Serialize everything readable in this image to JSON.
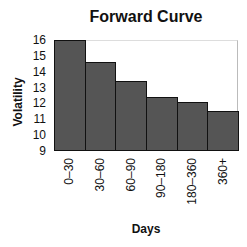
{
  "chart_data": {
    "type": "bar",
    "title": "Forward Curve",
    "xlabel": "Days",
    "ylabel": "Volatility",
    "categories": [
      "0–30",
      "30–60",
      "60–90",
      "90–180",
      "180–360",
      "360+"
    ],
    "values": [
      16.0,
      14.6,
      13.4,
      12.4,
      12.1,
      11.5
    ],
    "ylim": [
      9,
      16
    ],
    "yticks": [
      "16",
      "15",
      "14",
      "13",
      "12",
      "11",
      "10",
      "9"
    ],
    "grid": false,
    "legend": null,
    "bar_color": "#555555"
  }
}
